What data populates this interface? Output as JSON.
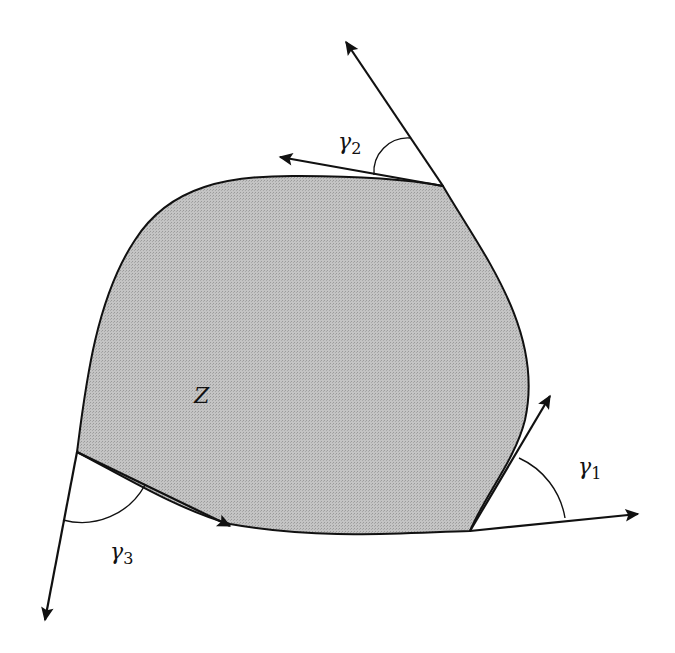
{
  "figure": {
    "region_label": "Z",
    "colors": {
      "region_fill": "#bdbdbd",
      "stroke": "#111111",
      "background": "#ffffff"
    },
    "corners": [
      {
        "id": "corner-1",
        "angle_label": "γ",
        "angle_subscript": "1"
      },
      {
        "id": "corner-2",
        "angle_label": "γ",
        "angle_subscript": "2"
      },
      {
        "id": "corner-3",
        "angle_label": "γ",
        "angle_subscript": "3"
      }
    ]
  }
}
